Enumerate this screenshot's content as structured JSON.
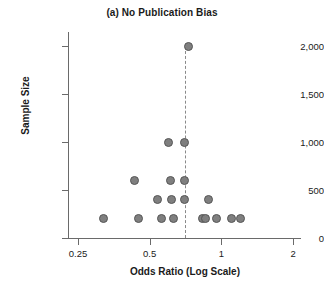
{
  "chart_data": {
    "type": "scatter",
    "title": "(a) No Publication Bias",
    "xlabel": "Odds Ratio (Log Scale)",
    "ylabel": "Sample Size",
    "xscale": "log",
    "yscale": "linear",
    "xlim": [
      0.25,
      2
    ],
    "ylim": [
      0,
      2000
    ],
    "xticks": [
      0.25,
      0.5,
      1,
      2
    ],
    "xtick_labels": [
      "0.25",
      "0.5",
      "1",
      "2"
    ],
    "yticks": [
      0,
      500,
      1000,
      1500,
      2000
    ],
    "ytick_labels": [
      "0",
      "500",
      "1,000",
      "1,500",
      "2,000"
    ],
    "grid": false,
    "legend": false,
    "marker_color": "#7f7f7f",
    "marker_edge_color": "#565656",
    "axis_color": "#6a6a6a",
    "reference_line": {
      "label": "pooled effect reference",
      "x": 0.7,
      "style": "dashed",
      "color": "#8a8a8a",
      "y_start": 2000,
      "y_end": 0
    },
    "points": [
      {
        "x": 0.32,
        "y": 200
      },
      {
        "x": 0.43,
        "y": 600
      },
      {
        "x": 0.45,
        "y": 200
      },
      {
        "x": 0.54,
        "y": 400
      },
      {
        "x": 0.56,
        "y": 200
      },
      {
        "x": 0.6,
        "y": 1000
      },
      {
        "x": 0.61,
        "y": 600
      },
      {
        "x": 0.62,
        "y": 400
      },
      {
        "x": 0.63,
        "y": 200
      },
      {
        "x": 0.7,
        "y": 1000
      },
      {
        "x": 0.7,
        "y": 600
      },
      {
        "x": 0.7,
        "y": 400
      },
      {
        "x": 0.73,
        "y": 2000
      },
      {
        "x": 0.83,
        "y": 200
      },
      {
        "x": 0.86,
        "y": 200
      },
      {
        "x": 0.88,
        "y": 400
      },
      {
        "x": 0.95,
        "y": 200
      },
      {
        "x": 1.1,
        "y": 200
      },
      {
        "x": 1.2,
        "y": 200
      }
    ]
  }
}
